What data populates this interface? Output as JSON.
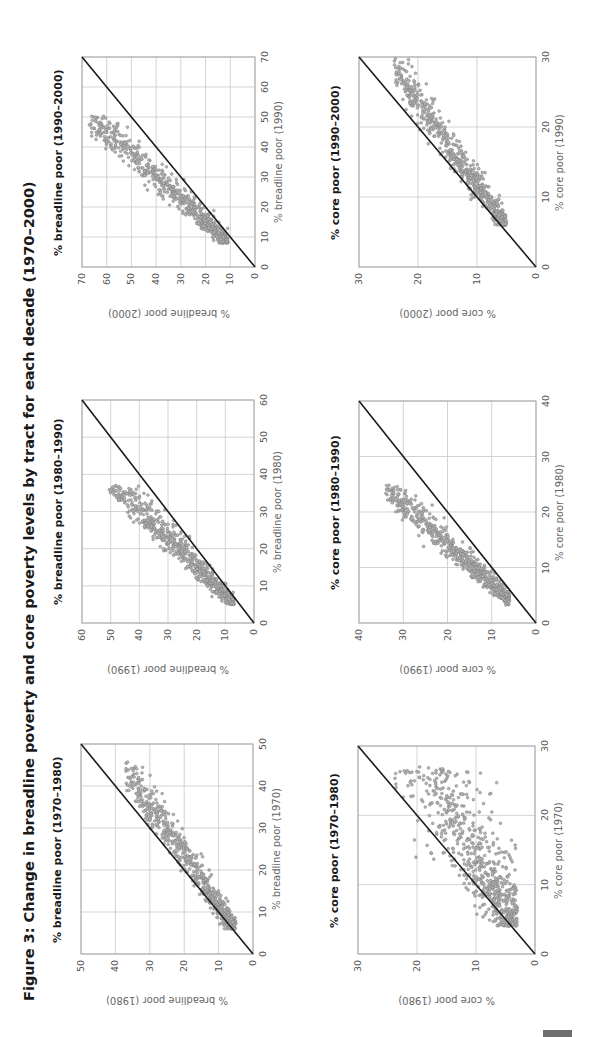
{
  "figure": {
    "title": "Figure 3: Change in breadline poverty and core poverty levels by tract for each decade (1970–2000)",
    "orientation": "rotated 90° counter-clockwise (landscape page)"
  },
  "chart_data": [
    {
      "id": "breadline_1970_1980",
      "type": "scatter",
      "title": "% breadline poor (1970–1980)",
      "xlabel": "% breadline poor (1970)",
      "ylabel": "% breadline poor (1980)",
      "xlim": [
        0,
        50
      ],
      "ylim": [
        0,
        50
      ],
      "xticks": [
        "0",
        "10",
        "20",
        "30",
        "40",
        "50"
      ],
      "yticks": [
        "0",
        "10",
        "20",
        "30",
        "40",
        "50"
      ],
      "grid": true,
      "reference_line": "y = x",
      "cloud": {
        "x_range": [
          6,
          46
        ],
        "y_range": [
          5,
          37
        ],
        "center": [
          20,
          17
        ],
        "trend": "mostly below y=x; higher 1970 tracts declined by ~25%"
      }
    },
    {
      "id": "breadline_1980_1990",
      "type": "scatter",
      "title": "% breadline poor (1980–1990)",
      "xlabel": "% breadline poor (1980)",
      "ylabel": "% breadline poor (1990)",
      "xlim": [
        0,
        60
      ],
      "ylim": [
        0,
        60
      ],
      "xticks": [
        "0",
        "10",
        "20",
        "30",
        "40",
        "50",
        "60"
      ],
      "yticks": [
        "0",
        "10",
        "20",
        "30",
        "40",
        "50",
        "60"
      ],
      "grid": true,
      "reference_line": "y = x",
      "cloud": {
        "x_range": [
          5,
          37
        ],
        "y_range": [
          7,
          51
        ],
        "center": [
          17,
          22
        ],
        "trend": "above y=x; 1990 levels ~1.3× 1980"
      }
    },
    {
      "id": "breadline_1990_2000",
      "type": "scatter",
      "title": "% breadline poor (1990–2000)",
      "xlabel": "% breadline poor (1990)",
      "ylabel": "% breadline poor (2000)",
      "xlim": [
        0,
        70
      ],
      "ylim": [
        0,
        70
      ],
      "xticks": [
        "0",
        "10",
        "20",
        "30",
        "40",
        "50",
        "60",
        "70"
      ],
      "yticks": [
        "0",
        "10",
        "20",
        "30",
        "40",
        "50",
        "60",
        "70"
      ],
      "grid": true,
      "reference_line": "y = x",
      "cloud": {
        "x_range": [
          8,
          51
        ],
        "y_range": [
          11,
          67
        ],
        "center": [
          22,
          29
        ],
        "trend": "above y=x; 2000 levels ~1.3× 1990"
      }
    },
    {
      "id": "core_1970_1980",
      "type": "scatter",
      "title": "% core poor (1970–1980)",
      "xlabel": "% core poor (1970)",
      "ylabel": "% core poor (1980)",
      "xlim": [
        0,
        30
      ],
      "ylim": [
        0,
        30
      ],
      "xticks": [
        "0",
        "10",
        "20",
        "30"
      ],
      "yticks": [
        "0",
        "10",
        "20",
        "30"
      ],
      "grid": true,
      "reference_line": "y = x",
      "cloud": {
        "x_range": [
          4,
          27
        ],
        "y_range": [
          3,
          25
        ],
        "center": [
          13,
          9
        ],
        "trend": "mostly below y=x, wide dispersion"
      }
    },
    {
      "id": "core_1980_1990",
      "type": "scatter",
      "title": "% core poor (1980–1990)",
      "xlabel": "% core poor (1980)",
      "ylabel": "% core poor (1990)",
      "xlim": [
        0,
        40
      ],
      "ylim": [
        0,
        40
      ],
      "xticks": [
        "0",
        "10",
        "20",
        "30",
        "40"
      ],
      "yticks": [
        "0",
        "10",
        "20",
        "30",
        "40"
      ],
      "grid": true,
      "reference_line": "y = x",
      "cloud": {
        "x_range": [
          3,
          25
        ],
        "y_range": [
          6,
          34
        ],
        "center": [
          10,
          14
        ],
        "trend": "above y=x; 1990 levels ~1.4× 1980"
      }
    },
    {
      "id": "core_1990_2000",
      "type": "scatter",
      "title": "% core poor (1990–2000)",
      "xlabel": "% core poor (1990)",
      "ylabel": "% core poor (2000)",
      "xlim": [
        0,
        30
      ],
      "ylim": [
        0,
        30
      ],
      "xticks": [
        "0",
        "10",
        "20",
        "30"
      ],
      "yticks": [
        "0",
        "10",
        "20",
        "30"
      ],
      "grid": true,
      "reference_line": "y = x",
      "cloud": {
        "x_range": [
          6,
          30
        ],
        "y_range": [
          5,
          24
        ],
        "center": [
          13,
          11
        ],
        "trend": "below y=x; 2000 levels ~0.8× 1990"
      }
    }
  ],
  "colors": {
    "marker_fill": "#b5b5b5",
    "marker_stroke": "#7a7a7a",
    "grid": "#c8c8c8",
    "frame": "#a8a8a8",
    "reference_line": "#1a1a1a",
    "corner_block": "#6e6e6e"
  }
}
